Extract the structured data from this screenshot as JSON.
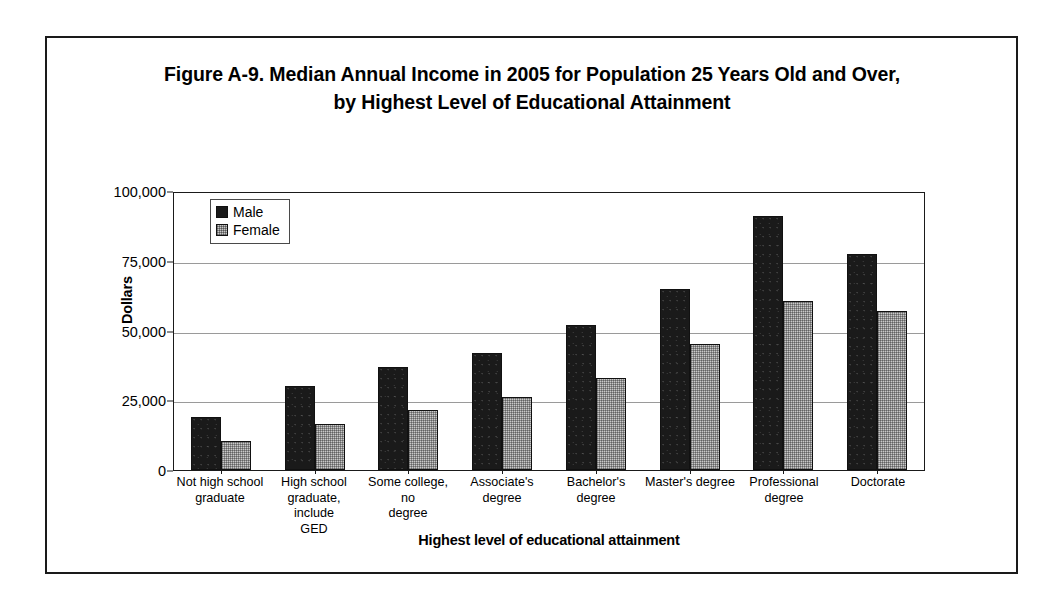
{
  "figure": {
    "title_line1": "Figure A-9. Median Annual Income in 2005 for Population 25 Years Old and Over,",
    "title_line2": "by Highest Level of Educational Attainment"
  },
  "chart_data": {
    "type": "bar",
    "title": "Figure A-9. Median Annual Income in 2005 for Population 25 Years Old and Over, by Highest Level of Educational Attainment",
    "xlabel": "Highest level of educational attainment",
    "ylabel": "Dollars",
    "ylim": [
      0,
      100000
    ],
    "yticks": [
      0,
      25000,
      50000,
      75000,
      100000
    ],
    "ytick_labels": [
      "0",
      "25,000",
      "50,000",
      "75,000",
      "100,000"
    ],
    "grid": true,
    "legend_position": "top-left inside plot",
    "categories": [
      "Not high school graduate",
      "High school graduate, include GED",
      "Some college, no degree",
      "Associate's degree",
      "Bachelor's degree",
      "Master's degree",
      "Professional degree",
      "Doctorate"
    ],
    "category_labels_wrapped": [
      [
        "Not high school",
        "graduate"
      ],
      [
        "High school",
        "graduate, include",
        "GED"
      ],
      [
        "Some college, no",
        "degree"
      ],
      [
        "Associate's",
        "degree"
      ],
      [
        "Bachelor's",
        "degree"
      ],
      [
        "Master's degree"
      ],
      [
        "Professional",
        "degree"
      ],
      [
        "Doctorate"
      ]
    ],
    "series": [
      {
        "name": "Male",
        "color": "#1a1a1a",
        "values": [
          19000,
          30000,
          37000,
          42000,
          52000,
          65000,
          91000,
          77500
        ]
      },
      {
        "name": "Female",
        "color": "#c9c9c9",
        "values": [
          10500,
          16500,
          21500,
          26000,
          33000,
          45000,
          60500,
          57000
        ]
      }
    ]
  }
}
